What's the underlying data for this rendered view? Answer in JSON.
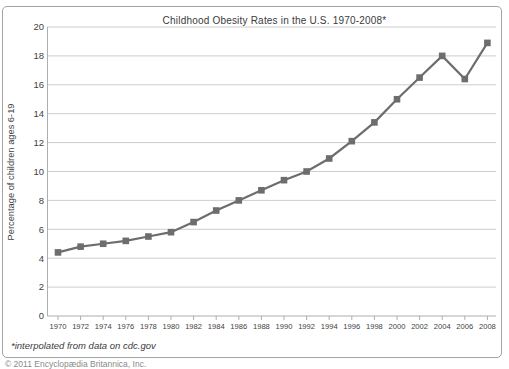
{
  "page": {
    "copyright_partial": "© 2011 Encyclopædia Britannica, Inc."
  },
  "chart_data": {
    "type": "line",
    "title": "Childhood Obesity Rates in the U.S. 1970-2008*",
    "ylabel": "Percentage of children ages 6-19",
    "xlabel": "",
    "footnote": "*interpolated from data on cdc.gov",
    "x": [
      1970,
      1972,
      1974,
      1976,
      1978,
      1980,
      1982,
      1984,
      1986,
      1988,
      1990,
      1992,
      1994,
      1996,
      1998,
      2000,
      2002,
      2004,
      2006,
      2008
    ],
    "values": [
      4.4,
      4.8,
      5.0,
      5.2,
      5.5,
      5.8,
      6.5,
      7.3,
      8.0,
      8.7,
      9.4,
      10.0,
      10.9,
      12.1,
      13.4,
      15.0,
      16.5,
      18.0,
      16.4,
      18.9
    ],
    "ylim": [
      0,
      20
    ],
    "ytick_step": 2,
    "grid": true,
    "legend": "none",
    "marker": "square",
    "line_color": "#6d6d6d",
    "grid_color": "#cdcdcd",
    "axis_color": "#aeaeae",
    "text_color": "#3f3f3f",
    "border_color": "#a3a3a3"
  }
}
